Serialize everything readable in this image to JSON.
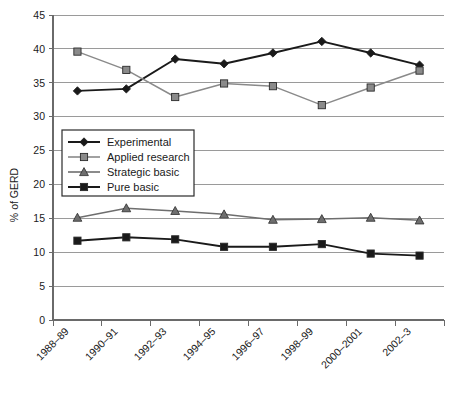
{
  "chart_data": {
    "type": "line",
    "title": "",
    "xlabel": "",
    "ylabel": "% of GERD",
    "ylim": [
      0,
      45
    ],
    "ytick_step": 5,
    "yticks": [
      "0",
      "5",
      "10",
      "15",
      "20",
      "25",
      "30",
      "35",
      "40",
      "45"
    ],
    "grid": true,
    "legend_position": "inside-left-middle",
    "categories": [
      "1988–89",
      "1990–91",
      "1992–93",
      "1994–95",
      "1996–97",
      "1998–99",
      "2000–2001",
      "2002–3"
    ],
    "series": [
      {
        "name": "Experimental",
        "marker": "diamond",
        "color": "#1a1a1a",
        "values": [
          33.8,
          34.1,
          38.5,
          37.8,
          39.4,
          41.1,
          39.4,
          37.6
        ]
      },
      {
        "name": "Applied research",
        "marker": "square",
        "color": "#8a8a8a",
        "values": [
          39.6,
          36.9,
          32.9,
          34.9,
          34.5,
          31.7,
          34.3,
          36.8
        ]
      },
      {
        "name": "Strategic basic",
        "marker": "triangle",
        "color": "#6e6e6e",
        "values": [
          15.1,
          16.5,
          16.1,
          15.6,
          14.8,
          14.9,
          15.1,
          14.7
        ]
      },
      {
        "name": "Pure basic",
        "marker": "square",
        "color": "#1a1a1a",
        "values": [
          11.7,
          12.2,
          11.9,
          10.8,
          10.8,
          11.2,
          9.8,
          9.5
        ]
      }
    ]
  },
  "axis": {
    "y_title": "% of GERD"
  },
  "legend": {
    "items": [
      {
        "label": "Experimental"
      },
      {
        "label": "Applied research"
      },
      {
        "label": "Strategic basic"
      },
      {
        "label": "Pure basic"
      }
    ]
  }
}
